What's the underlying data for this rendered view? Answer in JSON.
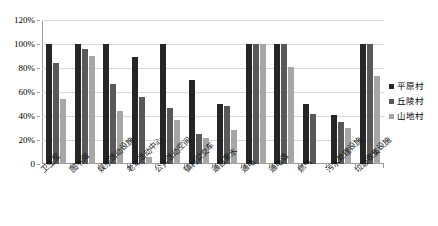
{
  "chart_data": {
    "type": "bar",
    "title": "",
    "xlabel": "",
    "ylabel": "",
    "ylim": [
      0,
      1.2
    ],
    "ytick_labels": [
      "0",
      "20%",
      "40%",
      "60%",
      "80%",
      "100%",
      "120%"
    ],
    "ytick_values": [
      0,
      0.2,
      0.4,
      0.6,
      0.8,
      1.0,
      1.2
    ],
    "grid": true,
    "legend_position": "right",
    "categories": [
      "卫生室",
      "图书阅",
      "娱乐活动设施",
      "老年活动中心",
      "公共活动空间",
      "镇村公交车",
      "通自来水",
      "通电",
      "通电话",
      "燃气",
      "污水处理设施",
      "垃圾收集设施"
    ],
    "series": [
      {
        "name": "平原村",
        "color": "#262626",
        "values": [
          1.0,
          1.0,
          1.0,
          0.89,
          1.0,
          0.7,
          0.5,
          1.0,
          1.0,
          0.5,
          0.41,
          1.0
        ]
      },
      {
        "name": "丘陵村",
        "color": "#595959",
        "values": [
          0.84,
          0.96,
          0.67,
          0.56,
          0.47,
          0.25,
          0.48,
          1.0,
          1.0,
          0.42,
          0.35,
          1.0
        ]
      },
      {
        "name": "山地村",
        "color": "#a6a6a6",
        "values": [
          0.54,
          0.9,
          0.44,
          0.06,
          0.37,
          0.22,
          0.28,
          1.0,
          0.81,
          0.0,
          0.3,
          0.73
        ]
      }
    ]
  }
}
